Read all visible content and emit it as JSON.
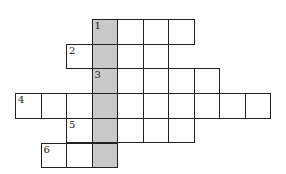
{
  "puzzle": {
    "type": "crossword",
    "origin": {
      "x": 15,
      "y": 19
    },
    "cell_w": 25.5,
    "cell_h": 24.7,
    "shaded_color": "#c9c9c9",
    "shaded_column": 3,
    "rows": [
      {
        "clue": "1",
        "row": 0,
        "start_col": 3,
        "length": 4
      },
      {
        "clue": "2",
        "row": 1,
        "start_col": 2,
        "length": 4
      },
      {
        "clue": "3",
        "row": 2,
        "start_col": 3,
        "length": 5
      },
      {
        "clue": "4",
        "row": 3,
        "start_col": 0,
        "length": 10
      },
      {
        "clue": "5",
        "row": 4,
        "start_col": 2,
        "length": 5
      },
      {
        "clue": "6",
        "row": 5,
        "start_col": 1,
        "length": 3
      }
    ]
  }
}
